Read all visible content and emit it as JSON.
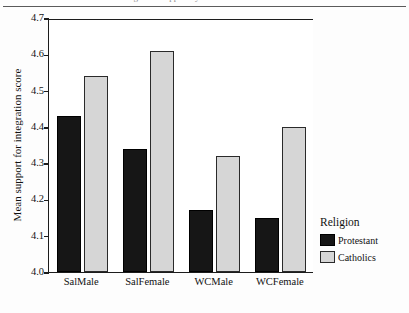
{
  "figure": {
    "cropped_title_fragment": "integration support by",
    "background": "#ffffff"
  },
  "chart_data": {
    "type": "bar",
    "title": "",
    "xlabel": "",
    "ylabel": "Mean support for integration score",
    "categories": [
      "SalMale",
      "SalFemale",
      "WCMale",
      "WCFemale"
    ],
    "series": [
      {
        "name": "Protestant",
        "color": "#161616",
        "values": [
          4.43,
          4.34,
          4.17,
          4.15
        ]
      },
      {
        "name": "Catholics",
        "color": "#d6d6d6",
        "values": [
          4.54,
          4.61,
          4.32,
          4.4
        ]
      }
    ],
    "ylim": [
      4.0,
      4.7
    ],
    "ytick_labels": [
      "4.7",
      "4.6",
      "4.5",
      "4.4",
      "4.3",
      "4.2",
      "4.1",
      "4.0"
    ],
    "ytick_values": [
      4.7,
      4.6,
      4.5,
      4.4,
      4.3,
      4.2,
      4.1,
      4.0
    ],
    "grid": false,
    "legend_position": "right"
  },
  "legend": {
    "title": "Religion",
    "entries": [
      {
        "label": "Protestant",
        "color": "#161616"
      },
      {
        "label": "Catholics",
        "color": "#d6d6d6"
      }
    ]
  }
}
